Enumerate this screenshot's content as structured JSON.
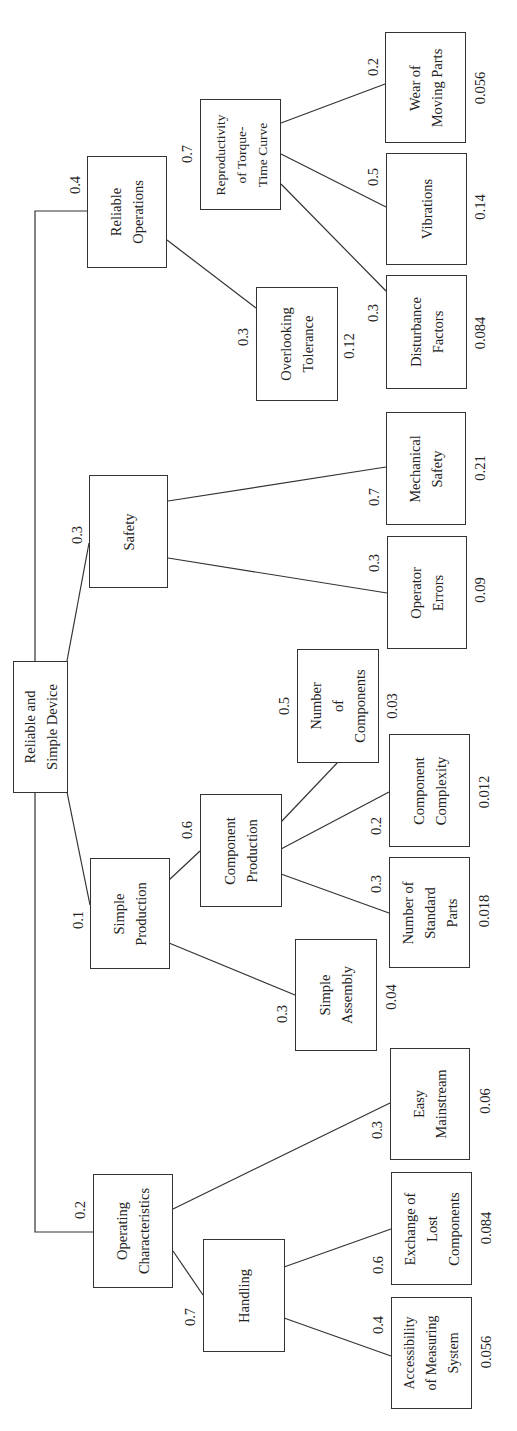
{
  "diagram": {
    "type": "hierarchy-tree",
    "orientation": "rotated-90-ccw",
    "root": {
      "id": "root",
      "label": "Reliable and\nSimple Device"
    },
    "nodes": [
      {
        "id": "rel_ops",
        "label": "Reliable\nOperations",
        "weight": "0.4",
        "parent": "root"
      },
      {
        "id": "safety",
        "label": "Safety",
        "weight": "0.3",
        "parent": "root"
      },
      {
        "id": "simple_prod",
        "label": "Simple\nProduction",
        "weight": "0.1",
        "parent": "root"
      },
      {
        "id": "op_char",
        "label": "Operating\nCharacteristics",
        "weight": "0.2",
        "parent": "root"
      },
      {
        "id": "reproductivity",
        "label": "Reproductivity\nof Torque-\nTime Curve",
        "weight": "0.7",
        "parent": "rel_ops"
      },
      {
        "id": "overlooking",
        "label": "Overlooking\nTolerance",
        "weight": "0.3",
        "global": "0.12",
        "parent": "rel_ops"
      },
      {
        "id": "wear",
        "label": "Wear of\nMoving Parts",
        "weight": "0.2",
        "global": "0.056",
        "parent": "reproductivity"
      },
      {
        "id": "vibrations",
        "label": "Vibrations",
        "weight": "0.5",
        "global": "0.14",
        "parent": "reproductivity"
      },
      {
        "id": "disturbance",
        "label": "Disturbance\nFactors",
        "weight": "0.3",
        "global": "0.084",
        "parent": "reproductivity"
      },
      {
        "id": "mech_safety",
        "label": "Mechanical\nSafety",
        "weight": "0.7",
        "global": "0.21",
        "parent": "safety"
      },
      {
        "id": "op_errors",
        "label": "Operator\nErrors",
        "weight": "0.3",
        "global": "0.09",
        "parent": "safety"
      },
      {
        "id": "comp_prod",
        "label": "Component\nProduction",
        "weight": "0.6",
        "parent": "simple_prod"
      },
      {
        "id": "simple_assembly",
        "label": "Simple\nAssembly",
        "weight": "0.3",
        "global": "0.04",
        "parent": "simple_prod"
      },
      {
        "id": "num_components",
        "label": "Number\nof\nComponents",
        "weight": "0.5",
        "global": "0.03",
        "parent": "comp_prod"
      },
      {
        "id": "comp_complexity",
        "label": "Component\nComplexity",
        "weight": "0.2",
        "global": "0.012",
        "parent": "comp_prod"
      },
      {
        "id": "num_std_parts",
        "label": "Number of\nStandard\nParts",
        "weight": "0.3",
        "global": "0.018",
        "parent": "comp_prod"
      },
      {
        "id": "easy_main",
        "label": "Easy\nMainstream",
        "weight": "0.3",
        "global": "0.06",
        "parent": "op_char"
      },
      {
        "id": "handling",
        "label": "Handling",
        "weight": "0.7",
        "parent": "op_char"
      },
      {
        "id": "exchange",
        "label": "Exchange of\nLost\nComponents",
        "weight": "0.6",
        "global": "0.084",
        "parent": "handling"
      },
      {
        "id": "accessibility",
        "label": "Accessibility\nof Measuring\nSystem",
        "weight": "0.4",
        "global": "0.056",
        "parent": "handling"
      }
    ]
  }
}
